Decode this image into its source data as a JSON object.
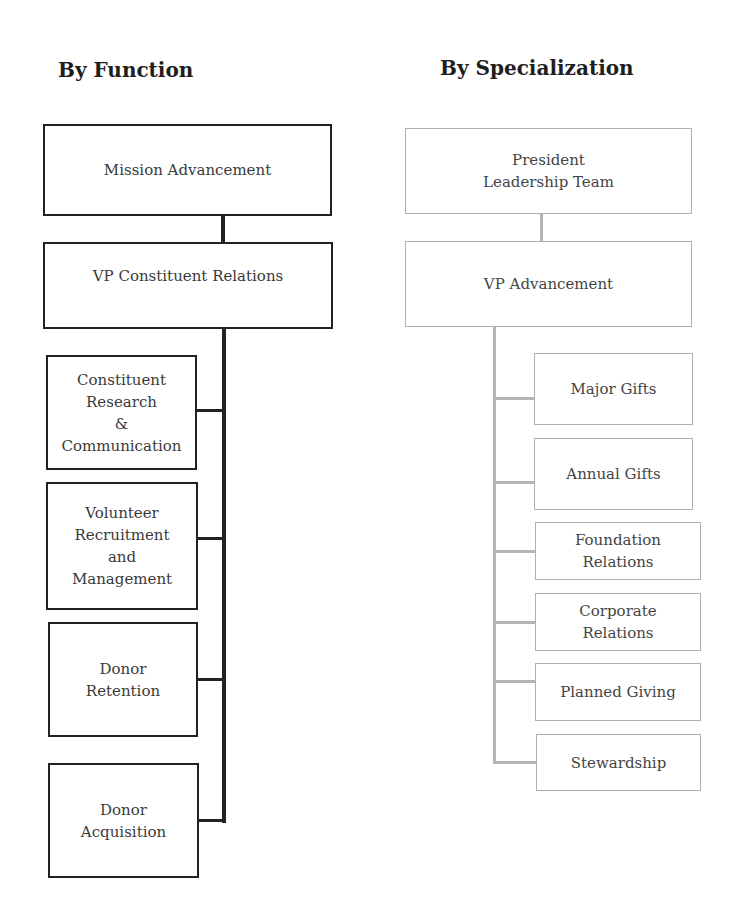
{
  "left_chart": {
    "title": "By Function",
    "root": "Mission Advancement",
    "vp": "VP Constituent Relations",
    "children": [
      "Constituent\nResearch\n&\nCommunication",
      "Volunteer\nRecruitment\nand\nManagement",
      "Donor\nRetention",
      "Donor\nAcquisition"
    ]
  },
  "right_chart": {
    "title": "By Specialization",
    "root": "President\nLeadership Team",
    "vp": "VP Advancement",
    "children": [
      "Major Gifts",
      "Annual Gifts",
      "Foundation\nRelations",
      "Corporate\nRelations",
      "Planned Giving",
      "Stewardship"
    ]
  },
  "colors": {
    "dark_line": "#222222",
    "light_line": "#b5b5b5"
  }
}
